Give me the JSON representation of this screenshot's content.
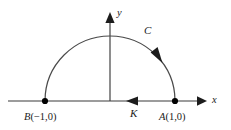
{
  "figure": {
    "background_color": "#ffffff",
    "stroke_color": "#3a3a3a",
    "label_color": "#1c1c1c"
  },
  "axes": {
    "x_label": "x",
    "y_label": "y",
    "x_axis_y": 101,
    "y_axis_x": 110,
    "x_start": 8,
    "x_end": 205,
    "y_top": 14
  },
  "curve": {
    "label": "C",
    "direction_arrow": "counterclockwise",
    "radius": 65,
    "apex_y": 36
  },
  "segment": {
    "label": "K",
    "direction_arrow": "leftward"
  },
  "points": [
    {
      "name": "B",
      "label_name": "B",
      "label_coords": "(−1,0)",
      "x": 45,
      "y": 101
    },
    {
      "name": "A",
      "label_name": "A",
      "label_coords": "(1,0)",
      "x": 175,
      "y": 101
    }
  ]
}
